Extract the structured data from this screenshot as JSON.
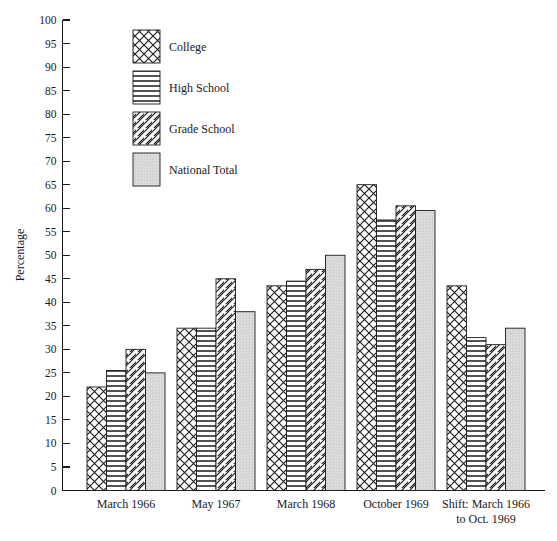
{
  "chart_data": {
    "type": "bar",
    "title": "",
    "subtitle": "",
    "xlabel": "",
    "ylabel": "Percentage",
    "ylim": [
      0,
      100
    ],
    "ytick_step": 5,
    "yticks": [
      0,
      5,
      10,
      15,
      20,
      25,
      30,
      35,
      40,
      45,
      50,
      55,
      60,
      65,
      70,
      75,
      80,
      85,
      90,
      95,
      100
    ],
    "grid": false,
    "legend_position": "top-left-inside",
    "categories": [
      "March 1966",
      "May 1967",
      "March 1968",
      "October 1969",
      "Shift: March 1966 to Oct. 1969"
    ],
    "category_labels_multiline": [
      [
        "March 1966"
      ],
      [
        "May 1967"
      ],
      [
        "March 1968"
      ],
      [
        "October 1969"
      ],
      [
        "Shift: March 1966",
        "to Oct. 1969"
      ]
    ],
    "series": [
      {
        "name": "College",
        "pattern": "cross-hatch",
        "values": [
          22,
          34.5,
          43.5,
          65,
          43.5
        ]
      },
      {
        "name": "High School",
        "pattern": "horizontal-lines",
        "values": [
          25.5,
          34.5,
          44.5,
          57.5,
          32.5
        ]
      },
      {
        "name": "Grade School",
        "pattern": "diagonal-lines",
        "values": [
          30,
          45,
          47,
          60.5,
          31
        ]
      },
      {
        "name": "National Total",
        "pattern": "solid-gray",
        "values": [
          25,
          38,
          50,
          59.5,
          34.5
        ]
      }
    ]
  },
  "legend": {
    "items": [
      {
        "label": "College",
        "pattern": "cross-hatch"
      },
      {
        "label": "High School",
        "pattern": "horizontal-lines"
      },
      {
        "label": "Grade School",
        "pattern": "diagonal-lines"
      },
      {
        "label": "National Total",
        "pattern": "solid-gray"
      }
    ]
  },
  "colors": {
    "ink": "#1a1a1a",
    "background": "#ffffff",
    "gray_fill": "#d9d9d9"
  }
}
